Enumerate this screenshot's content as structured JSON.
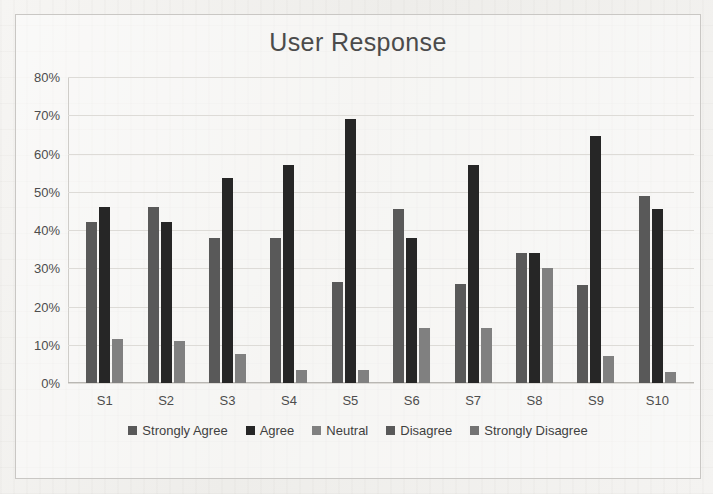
{
  "chart_data": {
    "type": "bar",
    "title": "User Response",
    "xlabel": "",
    "ylabel": "",
    "ylim": [
      0,
      80
    ],
    "ytick_labels": [
      "0%",
      "10%",
      "20%",
      "30%",
      "40%",
      "50%",
      "60%",
      "70%",
      "80%"
    ],
    "ytick_values": [
      0,
      10,
      20,
      30,
      40,
      50,
      60,
      70,
      80
    ],
    "grid": true,
    "legend_position": "bottom",
    "categories": [
      "S1",
      "S2",
      "S3",
      "S4",
      "S5",
      "S6",
      "S7",
      "S8",
      "S9",
      "S10"
    ],
    "series": [
      {
        "name": "Strongly Agree",
        "color": "#595959",
        "values": [
          42.0,
          46.0,
          38.0,
          38.0,
          26.5,
          45.5,
          26.0,
          34.0,
          25.5,
          49.0
        ]
      },
      {
        "name": "Agree",
        "color": "#262626",
        "values": [
          46.0,
          42.0,
          53.5,
          57.0,
          69.0,
          38.0,
          57.0,
          34.0,
          64.5,
          45.5
        ]
      },
      {
        "name": "Neutral",
        "color": "#808080",
        "values": [
          11.5,
          11.0,
          7.5,
          3.5,
          3.5,
          14.5,
          14.5,
          30.0,
          7.0,
          3.0
        ]
      },
      {
        "name": "Disagree",
        "color": "#595959",
        "values": [
          0,
          0,
          0,
          0,
          0,
          0,
          0,
          0,
          0,
          0
        ]
      },
      {
        "name": "Strongly Disagree",
        "color": "#737373",
        "values": [
          0,
          0,
          0,
          0,
          0,
          0,
          0,
          0,
          0,
          0
        ]
      }
    ]
  },
  "colors": {
    "page_background": "#f2f1ef",
    "frame_border": "#c9c7c4",
    "gridline": "#dddbd7",
    "title_text": "#4b4b4b",
    "tick_text": "#4d4d4d"
  }
}
